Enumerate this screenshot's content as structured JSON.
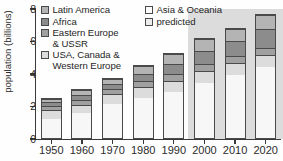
{
  "chart_data": {
    "type": "bar",
    "subtype": "stacked-bar",
    "title": "",
    "xlabel": "",
    "ylabel": "population (billions)",
    "categories": [
      "1950",
      "1960",
      "1970",
      "1980",
      "1990",
      "2000",
      "2010",
      "2020"
    ],
    "ylim": [
      0,
      8
    ],
    "yticks": [
      0,
      2,
      4,
      6,
      8
    ],
    "ytick_labels": [
      "0",
      "2",
      "4",
      "6",
      "8"
    ],
    "grid": false,
    "legend_position": "top-left-inside",
    "stack_order_bottom_to_top": [
      "Asia & Oceania",
      "USA, Canada & Western Europe",
      "Eastern Europe & USSR",
      "Africa",
      "Latin America"
    ],
    "series": [
      {
        "name": "Asia & Oceania",
        "color": "#f7f7f7",
        "values": [
          1.25,
          1.6,
          2.18,
          2.55,
          2.9,
          3.45,
          3.95,
          4.45
        ]
      },
      {
        "name": "USA, Canada & Western Europe",
        "color": "#dcdcdc",
        "values": [
          0.55,
          0.55,
          0.6,
          0.65,
          0.7,
          0.75,
          0.75,
          0.75
        ]
      },
      {
        "name": "Eastern Europe & USSR",
        "color": "#a0a0a0",
        "values": [
          0.27,
          0.3,
          0.32,
          0.38,
          0.42,
          0.45,
          0.45,
          0.45
        ]
      },
      {
        "name": "Africa",
        "color": "#8c8c8c",
        "values": [
          0.25,
          0.3,
          0.35,
          0.47,
          0.65,
          0.8,
          0.9,
          1.15
        ]
      },
      {
        "name": "Latin America",
        "color": "#b4b4b4",
        "values": [
          0.23,
          0.3,
          0.3,
          0.5,
          0.61,
          0.75,
          0.8,
          0.9
        ]
      }
    ],
    "totals": [
      2.55,
      3.05,
      3.75,
      4.55,
      5.28,
      6.2,
      6.85,
      7.7
    ],
    "predicted_from_category": "2000",
    "predicted_band_color": "#dcdcdc",
    "annotations": []
  },
  "legend": {
    "left_column": [
      {
        "label": "Latin America",
        "swatch": "#b4b4b4"
      },
      {
        "label": "Africa",
        "swatch": "#8c8c8c"
      },
      {
        "label": "Eastern Europe\n& USSR",
        "swatch": "#a0a0a0"
      },
      {
        "label": "USA, Canada &\nWestern Europe",
        "swatch": "#dcdcdc"
      }
    ],
    "right_column": [
      {
        "label": "Asia & Oceania",
        "swatch": "#fcfcfc"
      },
      {
        "label": "predicted",
        "swatch": "#ededed"
      }
    ]
  },
  "axes": {
    "y_title": "population (billions)",
    "y_tick_labels": [
      "8",
      "6",
      "4",
      "2",
      "0"
    ],
    "x_tick_labels": [
      "1950",
      "1960",
      "1970",
      "1980",
      "1990",
      "2000",
      "2010",
      "2020"
    ]
  }
}
